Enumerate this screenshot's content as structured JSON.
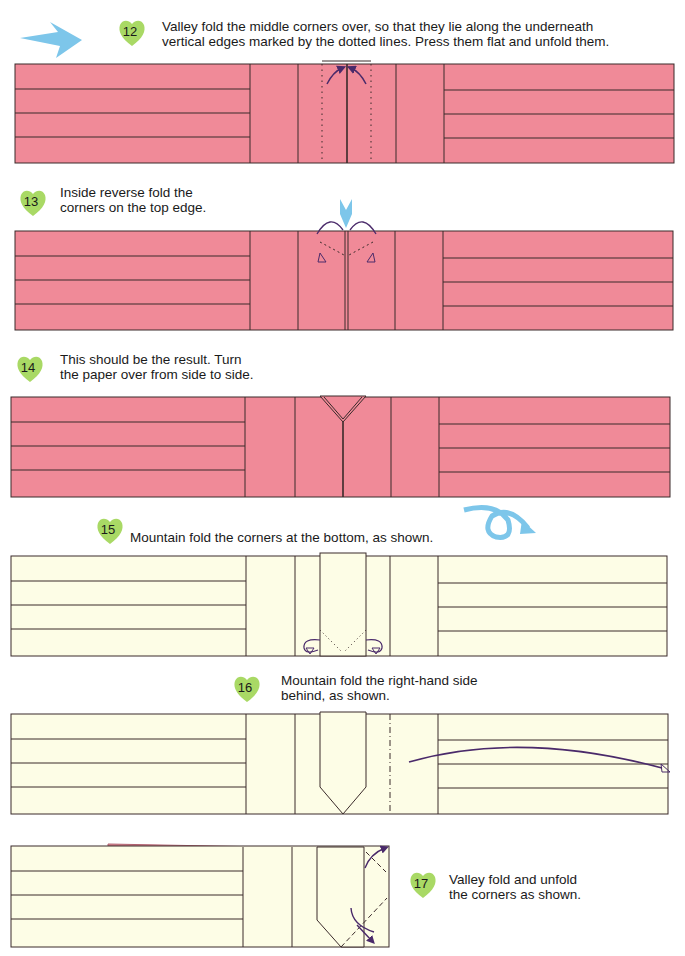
{
  "colors": {
    "pink_paper": "#f08a98",
    "cream_paper": "#fdfde6",
    "line": "#3a2a2a",
    "arrow_purple": "#4a2a6a",
    "arrow_blue": "#7dc6ea",
    "badge_green": "#9ad24a"
  },
  "steps": [
    {
      "number": "12",
      "text": "Valley fold the middle corners over, so that they lie along the underneath\nvertical edges marked by the dotted lines. Press them flat and unfold them."
    },
    {
      "number": "13",
      "text": "Inside reverse fold the\ncorners on the top edge."
    },
    {
      "number": "14",
      "text": "This should be the result. Turn\nthe paper over from side to side."
    },
    {
      "number": "15",
      "text": "Mountain fold the corners at the bottom, as shown."
    },
    {
      "number": "16",
      "text": "Mountain fold the right-hand side\nbehind, as shown."
    },
    {
      "number": "17",
      "text": "Valley fold and unfold\nthe corners as shown."
    }
  ],
  "icons": {
    "step12_arrow": "blue-arrow-right",
    "step15_arrow": "blue-turn-over-arrow"
  }
}
